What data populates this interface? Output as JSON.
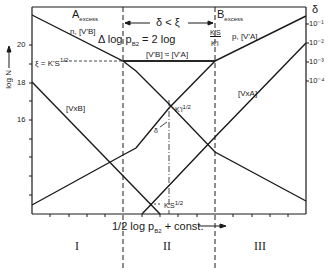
{
  "diagram": {
    "type": "Brouwer diagram (defect concentration vs. partial pressure)",
    "y_axis": {
      "label": "log N",
      "ticks": [
        "20",
        "18",
        "16"
      ]
    },
    "x_axis": {
      "label_prefix": "1/2",
      "label": "log p",
      "label_sub": "B2",
      "label_suffix": "+ const."
    },
    "right_axis": {
      "label": "δ",
      "ticks": [
        "10⁻¹",
        "10⁻²",
        "10⁻³",
        "10⁻⁴"
      ]
    },
    "regions": {
      "left_header": "A",
      "left_header_sub": "excess",
      "right_header": "B",
      "right_header_sub": "excess",
      "middle_header": "δ < ξ",
      "numerals": [
        "I",
        "II",
        "III"
      ]
    },
    "equations": {
      "delta_log": "Δ log p",
      "delta_log_sub": "B2",
      "delta_log_rhs": "= 2 log",
      "frac_num": "K'S",
      "frac_den": "K'i",
      "equal_approx": "[V'B] ≈ [V'A]",
      "xi_eq": "ξ = K'S",
      "xi_eq_sup": "1/2"
    },
    "curve_labels": {
      "n_VB": "n, [V'B]",
      "p_VA": "p, [V'A]",
      "VBx": "[VxB]",
      "VAx": "[VxA]",
      "Ki": "K'i",
      "Ki_sup": "1/2",
      "Ks": "K'S",
      "Ks_sup": "1/2",
      "delta_mark": "δ"
    }
  }
}
